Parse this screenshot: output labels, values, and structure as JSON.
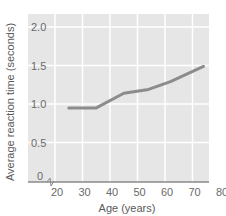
{
  "chart_data": {
    "type": "line",
    "title": "",
    "xlabel": "Age (years)",
    "ylabel": "Average reaction time (seconds)",
    "x_ticks": [
      20,
      30,
      40,
      50,
      60,
      70,
      80
    ],
    "y_ticks": [
      "0",
      "0.5",
      "1.0",
      "1.5",
      "2.0"
    ],
    "xlim": [
      20,
      80
    ],
    "ylim": [
      0,
      2.0
    ],
    "grid": true,
    "axis_break": "x-axis broken near origin (zigzag)",
    "series": [
      {
        "name": "Average reaction time",
        "color": "#8c8c8c",
        "x": [
          25,
          35,
          45,
          54,
          62,
          74
        ],
        "y": [
          0.95,
          0.95,
          1.14,
          1.19,
          1.29,
          1.49
        ]
      }
    ],
    "colors": {
      "plot_background": "#e6e6e6",
      "grid": "#ffffff",
      "line": "#8c8c8c",
      "axis": "#8a8a8a"
    }
  }
}
